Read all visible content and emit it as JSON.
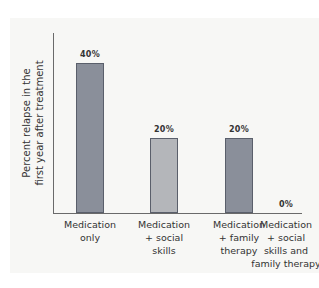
{
  "chart_data": {
    "type": "bar",
    "title": "",
    "xlabel": "",
    "ylabel": "Percent relapse in the first year after treatment",
    "ylabel_lines": [
      "Percent relapse in the",
      "first year after treatment"
    ],
    "categories": [
      "Medication only",
      "Medication + social skills",
      "Medication + family therapy",
      "Medication + social skills and family therapy"
    ],
    "category_lines": [
      [
        "Medication",
        "only"
      ],
      [
        "Medication",
        "+ social",
        "skills"
      ],
      [
        "Medication",
        "+ family",
        "therapy"
      ],
      [
        "Medication",
        "+ social",
        "skills and",
        "family therapy"
      ]
    ],
    "values": [
      40,
      20,
      20,
      0
    ],
    "value_labels": [
      "40%",
      "20%",
      "20%",
      "0%"
    ],
    "bar_colors": [
      "#8a8f9a",
      "#b4b6ba",
      "#8a8f9a",
      "#8a8f9a"
    ],
    "ylim": [
      0,
      50
    ],
    "grid": false,
    "legend": null
  }
}
